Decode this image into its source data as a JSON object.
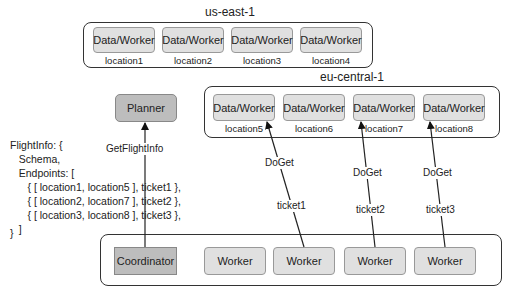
{
  "regions": {
    "us_east": {
      "label": "us-east-1",
      "nodes": [
        {
          "label": "Data/Worker",
          "location": "location1"
        },
        {
          "label": "Data/Worker",
          "location": "location2"
        },
        {
          "label": "Data/Worker",
          "location": "location3"
        },
        {
          "label": "Data/Worker",
          "location": "location4"
        }
      ]
    },
    "eu_central": {
      "label": "eu-central-1",
      "nodes": [
        {
          "label": "Data/Worker",
          "location": "location5"
        },
        {
          "label": "Data/Worker",
          "location": "location6"
        },
        {
          "label": "Data/Worker",
          "location": "location7"
        },
        {
          "label": "Data/Worker",
          "location": "location8"
        }
      ]
    },
    "compute": {
      "coordinator": "Coordinator",
      "workers": [
        "Worker",
        "Worker",
        "Worker",
        "Worker"
      ]
    }
  },
  "planner": {
    "label": "Planner"
  },
  "edges": {
    "get_flight_info": "GetFlightInfo",
    "doget": [
      {
        "method": "DoGet",
        "ticket": "ticket1"
      },
      {
        "method": "DoGet",
        "ticket": "ticket2"
      },
      {
        "method": "DoGet",
        "ticket": "ticket3"
      }
    ]
  },
  "flight_info": {
    "lines": [
      "FlightInfo: {",
      "   Schema,",
      "   Endpoints: [",
      "      { [ location1, location5 ], ticket1 },",
      "      { [ location2, location7 ], ticket2 },",
      "      { [ location3, location8 ], ticket3 },",
      "   ]",
      "}"
    ]
  }
}
